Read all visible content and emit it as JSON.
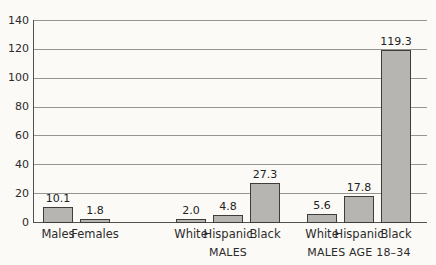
{
  "chart_data": {
    "type": "bar",
    "title": "",
    "xlabel": "",
    "ylabel": "",
    "ylim": [
      0,
      140
    ],
    "yticks": [
      "0",
      "20",
      "40",
      "60",
      "80",
      "100",
      "120",
      "140"
    ],
    "grid": "horizontal",
    "legend": "none",
    "colors": {
      "bar_fill": "#b6b5b2",
      "bar_border": "#3e3d3b",
      "gridline": "#979590",
      "axis": "#53514d",
      "text": "#2b2b2b",
      "background": "#fbfaf7"
    },
    "groups": [
      {
        "label": "",
        "bars": [
          {
            "category": "Males",
            "value": 10.1,
            "value_label": "10.1"
          },
          {
            "category": "Females",
            "value": 1.8,
            "value_label": "1.8"
          }
        ]
      },
      {
        "label": "MALES",
        "bars": [
          {
            "category": "White",
            "value": 2.0,
            "value_label": "2.0"
          },
          {
            "category": "Hispanic",
            "value": 4.8,
            "value_label": "4.8"
          },
          {
            "category": "Black",
            "value": 27.3,
            "value_label": "27.3"
          }
        ]
      },
      {
        "label": "MALES AGE 18–34",
        "bars": [
          {
            "category": "White",
            "value": 5.6,
            "value_label": "5.6"
          },
          {
            "category": "Hispanic",
            "value": 17.8,
            "value_label": "17.8"
          },
          {
            "category": "Black",
            "value": 119.3,
            "value_label": "119.3"
          }
        ]
      }
    ]
  }
}
